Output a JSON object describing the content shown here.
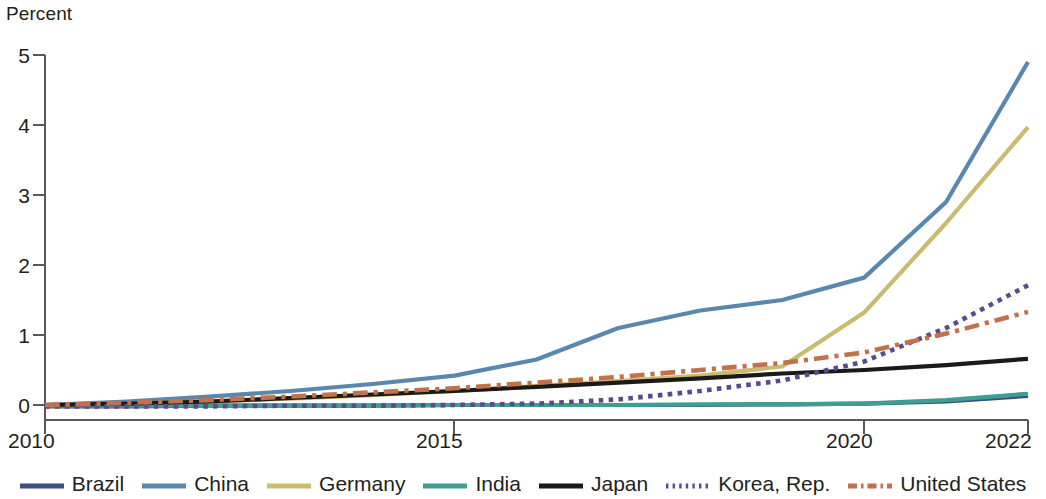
{
  "axis": {
    "y_title": "Percent",
    "y_ticks": [
      "0",
      "1",
      "2",
      "3",
      "4",
      "5"
    ],
    "x_ticks": [
      "2010",
      "2015",
      "2020",
      "2022"
    ]
  },
  "legend": {
    "items": [
      {
        "label": "Brazil",
        "color": "#3c4f80",
        "style": "solid",
        "name": "legend-item-brazil"
      },
      {
        "label": "China",
        "color": "#5b87ae",
        "style": "solid",
        "name": "legend-item-china"
      },
      {
        "label": "Germany",
        "color": "#c9bc70",
        "style": "solid",
        "name": "legend-item-germany"
      },
      {
        "label": "India",
        "color": "#3f9e92",
        "style": "solid",
        "name": "legend-item-india"
      },
      {
        "label": "Japan",
        "color": "#1a1a1a",
        "style": "solid",
        "name": "legend-item-japan"
      },
      {
        "label": "Korea, Rep.",
        "color": "#5b4a8c",
        "style": "dotted",
        "name": "legend-item-korea-rep"
      },
      {
        "label": "United States",
        "color": "#c1714b",
        "style": "dashdot",
        "name": "legend-item-united-states"
      }
    ]
  },
  "chart_data": {
    "type": "line",
    "title": "",
    "subtitle": "",
    "xlabel": "",
    "ylabel": "Percent",
    "xlim": [
      2010,
      2022
    ],
    "ylim": [
      0,
      5
    ],
    "grid": false,
    "legend_position": "bottom",
    "x": [
      2010,
      2011,
      2012,
      2013,
      2014,
      2015,
      2016,
      2017,
      2018,
      2019,
      2020,
      2021,
      2022
    ],
    "series": [
      {
        "name": "Brazil",
        "color": "#3c4f80",
        "style": "solid",
        "values": [
          -0.02,
          -0.02,
          -0.01,
          -0.01,
          -0.01,
          0.0,
          0.0,
          0.0,
          0.0,
          0.01,
          0.02,
          0.05,
          0.13
        ]
      },
      {
        "name": "China",
        "color": "#5b87ae",
        "style": "solid",
        "values": [
          0.0,
          0.05,
          0.12,
          0.2,
          0.3,
          0.42,
          0.65,
          1.1,
          1.35,
          1.5,
          1.82,
          2.9,
          4.9
        ]
      },
      {
        "name": "Germany",
        "color": "#c9bc70",
        "style": "solid",
        "values": [
          0.0,
          0.02,
          0.05,
          0.09,
          0.14,
          0.2,
          0.27,
          0.34,
          0.42,
          0.55,
          1.32,
          2.6,
          3.97
        ]
      },
      {
        "name": "India",
        "color": "#3f9e92",
        "style": "solid",
        "values": [
          -0.01,
          -0.01,
          -0.01,
          -0.01,
          -0.01,
          0.0,
          0.0,
          0.0,
          0.01,
          0.01,
          0.02,
          0.07,
          0.16
        ]
      },
      {
        "name": "Japan",
        "color": "#1a1a1a",
        "style": "solid",
        "values": [
          0.0,
          0.02,
          0.05,
          0.1,
          0.15,
          0.2,
          0.26,
          0.32,
          0.38,
          0.45,
          0.5,
          0.57,
          0.66
        ]
      },
      {
        "name": "Korea, Rep.",
        "color": "#5b4a8c",
        "style": "dotted",
        "values": [
          -0.02,
          -0.02,
          -0.02,
          -0.01,
          -0.01,
          0.0,
          0.02,
          0.08,
          0.2,
          0.35,
          0.62,
          1.1,
          1.71
        ]
      },
      {
        "name": "United States",
        "color": "#c1714b",
        "style": "dashdot",
        "values": [
          0.0,
          0.03,
          0.07,
          0.12,
          0.18,
          0.24,
          0.32,
          0.4,
          0.5,
          0.6,
          0.75,
          1.02,
          1.33
        ]
      }
    ],
    "zero_reference": {
      "name": "Korea, Rep. near-zero dashed baseline",
      "value": 0.0
    }
  }
}
